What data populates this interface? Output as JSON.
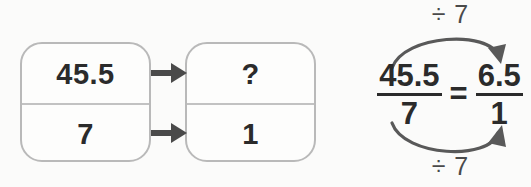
{
  "diagram": {
    "type": "ratio-equivalence",
    "left_box": {
      "top_value": "45.5",
      "bottom_value": "7"
    },
    "right_box": {
      "top_value": "?",
      "bottom_value": "1"
    },
    "arrows": {
      "top_arrow": "arrow-right",
      "bottom_arrow": "arrow-right"
    }
  },
  "equation": {
    "left_fraction": {
      "numerator": "45.5",
      "denominator": "7"
    },
    "relation": "=",
    "right_fraction": {
      "numerator": "6.5",
      "denominator": "1"
    },
    "top_operation_label": "÷ 7",
    "bottom_operation_label": "÷ 7"
  },
  "colors": {
    "box_border": "#b9b9b9",
    "divider": "#c2c2c2",
    "text": "#2b2b2b",
    "label_text": "#4a4a4a",
    "arrow": "#4a4a4a",
    "background": "#fbfbfa"
  }
}
